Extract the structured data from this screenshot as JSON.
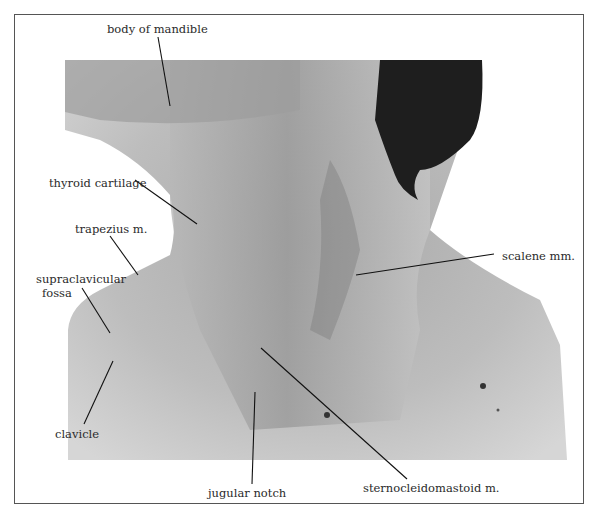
{
  "figure": {
    "labels": [
      {
        "id": "body-of-mandible",
        "text": "body of mandible"
      },
      {
        "id": "thyroid-cartilage",
        "text": "thyroid cartilage"
      },
      {
        "id": "trapezius",
        "text": "trapezius m."
      },
      {
        "id": "supraclavicular-fossa-line1",
        "text": "supraclavicular"
      },
      {
        "id": "supraclavicular-fossa-line2",
        "text": "fossa"
      },
      {
        "id": "clavicle",
        "text": "clavicle"
      },
      {
        "id": "jugular-notch",
        "text": "jugular notch"
      },
      {
        "id": "sternocleidomastoid",
        "text": "sternocleidomastoid m."
      },
      {
        "id": "scalene",
        "text": "scalene mm."
      }
    ]
  }
}
